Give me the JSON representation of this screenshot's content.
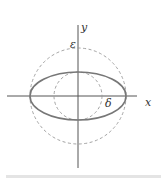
{
  "diagram": {
    "type": "geometry",
    "axes": {
      "x_label": "x",
      "y_label": "y"
    },
    "shapes": [
      {
        "name": "outer-circle",
        "style": "dashed",
        "radius_label": "ε"
      },
      {
        "name": "inner-circle",
        "style": "dashed",
        "radius_label": "δ"
      },
      {
        "name": "ellipse",
        "style": "solid",
        "semi_major": "ε",
        "semi_minor": "δ"
      }
    ],
    "labels": {
      "epsilon": "ε",
      "delta": "δ",
      "x": "x",
      "y": "y"
    }
  },
  "colors": {
    "axis": "#555555",
    "ellipse": "#777777",
    "dashed": "#999999"
  }
}
